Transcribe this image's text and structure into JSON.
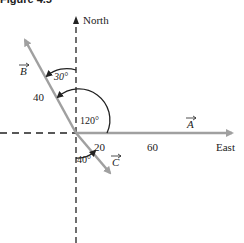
{
  "figure": {
    "caption": "Figure 4.5",
    "axes": {
      "north_label": "North",
      "east_label": "East"
    },
    "vectors": [
      {
        "name": "A",
        "label": "A",
        "magnitude": "60",
        "direction": "East"
      },
      {
        "name": "B",
        "label": "B",
        "magnitude": "40",
        "angle_from_north": "30°",
        "angle_from_east": "120°"
      },
      {
        "name": "C",
        "label": "C",
        "magnitude": "20",
        "angle_from_south": "40°"
      }
    ],
    "angles": {
      "b_from_north": "30°",
      "b_from_east": "120°",
      "c_from_south": "40°"
    },
    "colors": {
      "vector": "#a0a0a0",
      "axis": "#222222",
      "arc": "#222222"
    }
  }
}
